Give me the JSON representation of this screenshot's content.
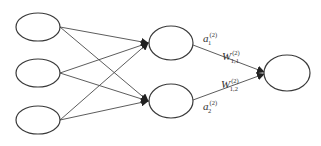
{
  "diagram": {
    "type": "neural-network",
    "layers": [
      {
        "name": "input",
        "nodes": 3
      },
      {
        "name": "hidden",
        "nodes": 2
      },
      {
        "name": "output",
        "nodes": 1
      }
    ],
    "colors": {
      "stroke": "#3a3a3a",
      "fill": "#ffffff",
      "text": "#333333"
    },
    "labels": {
      "a1": {
        "base": "a",
        "sup": "(2)",
        "sub": "1"
      },
      "a2": {
        "base": "a",
        "sup": "(2)",
        "sub": "2"
      },
      "w11": {
        "base": "W",
        "sup": "(2)",
        "sub": "1,1"
      },
      "w12": {
        "base": "W",
        "sup": "(2)",
        "sub": "1,2"
      }
    }
  }
}
